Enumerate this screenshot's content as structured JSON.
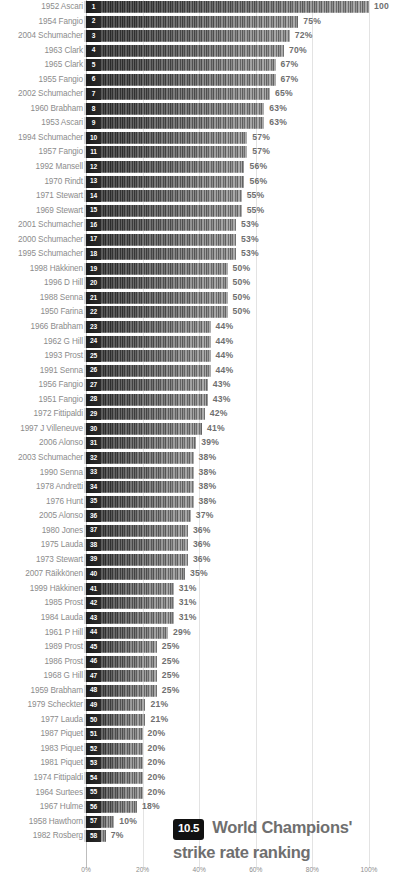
{
  "chart_data": {
    "type": "bar",
    "orientation": "horizontal",
    "title_line1": "World Champions'",
    "title_line2": "strike rate ranking",
    "badge": "10.5",
    "xlabel": "",
    "ylabel": "",
    "xlim": [
      0,
      100
    ],
    "grid": true,
    "gridlines_at": [
      0,
      20,
      40,
      60,
      80,
      100
    ],
    "tick_labels": [
      "0%",
      "20%",
      "40%",
      "60%",
      "80%",
      "100%"
    ],
    "legend": null,
    "categories": [
      "1952 Ascari",
      "1954 Fangio",
      "2004 Schumacher",
      "1963 Clark",
      "1965 Clark",
      "1955 Fangio",
      "2002 Schumacher",
      "1960 Brabham",
      "1953 Ascari",
      "1994 Schumacher",
      "1957 Fangio",
      "1992 Mansell",
      "1970 Rindt",
      "1971 Stewart",
      "1969 Stewart",
      "2001 Schumacher",
      "2000 Schumacher",
      "1995 Schumacher",
      "1998 Häkkinen",
      "1996 D Hill",
      "1988 Senna",
      "1950 Farina",
      "1966 Brabham",
      "1962 G Hill",
      "1993 Prost",
      "1991 Senna",
      "1956 Fangio",
      "1951 Fangio",
      "1972 Fittipaldi",
      "1997 J Villeneuve",
      "2006 Alonso",
      "2003 Schumacher",
      "1990 Senna",
      "1978 Andretti",
      "1976 Hunt",
      "2005 Alonso",
      "1980 Jones",
      "1975 Lauda",
      "1973 Stewart",
      "2007 Räikkönen",
      "1999 Häkkinen",
      "1985 Prost",
      "1984 Lauda",
      "1961 P Hill",
      "1989 Prost",
      "1986 Prost",
      "1968 G Hill",
      "1959 Brabham",
      "1979 Scheckter",
      "1977 Lauda",
      "1987 Piquet",
      "1983 Piquet",
      "1981 Piquet",
      "1974 Fittipaldi",
      "1964 Surtees",
      "1967 Hulme",
      "1958 Hawthorn",
      "1982 Rosberg"
    ],
    "values": [
      100,
      75,
      72,
      70,
      67,
      67,
      65,
      63,
      63,
      57,
      57,
      56,
      56,
      55,
      55,
      53,
      53,
      53,
      50,
      50,
      50,
      50,
      44,
      44,
      44,
      44,
      43,
      43,
      42,
      41,
      39,
      38,
      38,
      38,
      38,
      37,
      36,
      36,
      36,
      35,
      31,
      31,
      31,
      29,
      25,
      25,
      25,
      25,
      21,
      21,
      20,
      20,
      20,
      20,
      20,
      18,
      10,
      7
    ],
    "value_labels": [
      "100",
      "75%",
      "72%",
      "70%",
      "67%",
      "67%",
      "65%",
      "63%",
      "63%",
      "57%",
      "57%",
      "56%",
      "56%",
      "55%",
      "55%",
      "53%",
      "53%",
      "53%",
      "50%",
      "50%",
      "50%",
      "50%",
      "44%",
      "44%",
      "44%",
      "44%",
      "43%",
      "43%",
      "42%",
      "41%",
      "39%",
      "38%",
      "38%",
      "38%",
      "38%",
      "37%",
      "36%",
      "36%",
      "36%",
      "35%",
      "31%",
      "31%",
      "31%",
      "29%",
      "25%",
      "25%",
      "25%",
      "25%",
      "21%",
      "21%",
      "20%",
      "20%",
      "20%",
      "20%",
      "20%",
      "18%",
      "10%",
      "7%"
    ],
    "ranks": [
      "1",
      "2",
      "3",
      "4",
      "5",
      "6",
      "7",
      "8",
      "9",
      "10",
      "11",
      "12",
      "13",
      "14",
      "15",
      "16",
      "17",
      "18",
      "19",
      "20",
      "21",
      "22",
      "23",
      "24",
      "25",
      "26",
      "27",
      "28",
      "29",
      "30",
      "31",
      "32",
      "33",
      "34",
      "35",
      "36",
      "37",
      "38",
      "39",
      "40",
      "41",
      "42",
      "43",
      "44",
      "45",
      "46",
      "47",
      "48",
      "49",
      "50",
      "51",
      "52",
      "53",
      "54",
      "55",
      "56",
      "57",
      "58"
    ],
    "colors": {
      "bar_dark": "#3a3a3a",
      "bar_light": "#a0a0a0",
      "label_gray": "#8c8c8c",
      "value_gray": "#6f6f6f",
      "grid_gray": "#e3e3e3",
      "badge_bg": "#111111",
      "badge_fg": "#ffffff"
    }
  }
}
